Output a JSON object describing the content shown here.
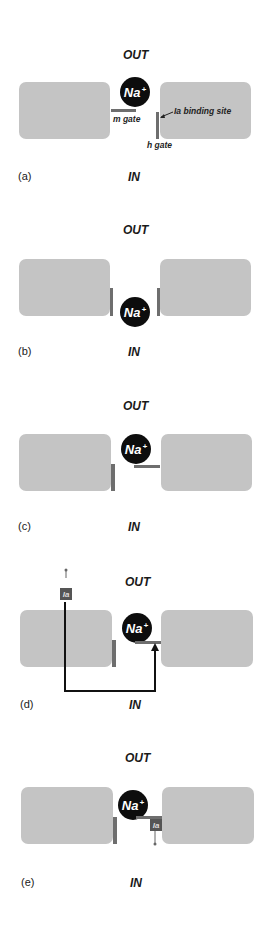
{
  "labels": {
    "out": "OUT",
    "in": "IN",
    "ion": "Na",
    "ion_charge": "+",
    "ia": "Ia"
  },
  "annotations": {
    "m_gate": "m gate",
    "h_gate": "h gate",
    "binding_site": "Ia binding site"
  },
  "panels": [
    {
      "id": "a",
      "label": "(a)",
      "m_gate": "closed",
      "h_gate": "open",
      "ion_position": "outside"
    },
    {
      "id": "b",
      "label": "(b)",
      "m_gate": "open",
      "h_gate": "open",
      "ion_position": "in-pore"
    },
    {
      "id": "c",
      "label": "(c)",
      "m_gate": "open",
      "h_gate": "closed",
      "ion_position": "outside"
    },
    {
      "id": "d",
      "label": "(d)",
      "m_gate": "open",
      "h_gate": "closed",
      "ion_position": "outside",
      "toxin": "approaching"
    },
    {
      "id": "e",
      "label": "(e)",
      "m_gate": "open",
      "h_gate": "closed",
      "ion_position": "outside",
      "toxin": "bound"
    }
  ],
  "colors": {
    "block": "#c4c4c4",
    "gate": "#6e6e6e",
    "ion": "#0d0d0d",
    "toxin": "#555555"
  }
}
